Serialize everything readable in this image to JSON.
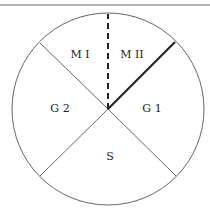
{
  "diagram": {
    "phases": [
      {
        "id": "mi",
        "label": "M I"
      },
      {
        "id": "mii",
        "label": "M II"
      },
      {
        "id": "g1",
        "label": "G 1"
      },
      {
        "id": "s",
        "label": "S"
      },
      {
        "id": "g2",
        "label": "G 2"
      }
    ],
    "colors": {
      "line": "#555555",
      "bold_line": "#222222",
      "text": "#222222",
      "rule": "#888888"
    }
  }
}
